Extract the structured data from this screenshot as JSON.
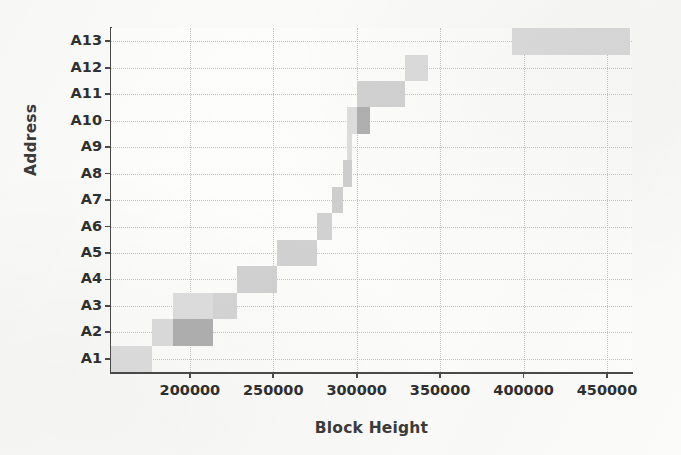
{
  "chart_data": {
    "type": "heatmap",
    "title": "",
    "xlabel": "Block Height",
    "ylabel": "Address",
    "xlim": [
      152700,
      465000
    ],
    "xticks": [
      200000,
      250000,
      300000,
      350000,
      400000,
      450000
    ],
    "xtick_labels": [
      "200000",
      "250000",
      "300000",
      "350000",
      "400000",
      "450000"
    ],
    "ylim": [
      0.5,
      13.5
    ],
    "yticks": [
      "A1",
      "A2",
      "A3",
      "A4",
      "A5",
      "A6",
      "A7",
      "A8",
      "A9",
      "A10",
      "A11",
      "A12",
      "A13"
    ],
    "categories": [
      "A1",
      "A2",
      "A3",
      "A4",
      "A5",
      "A6",
      "A7",
      "A8",
      "A9",
      "A10",
      "A11",
      "A12",
      "A13"
    ],
    "grid": true,
    "legend": "none",
    "colors": {
      "light": "#dedede",
      "medium": "#cfcfcf",
      "dark": "#b0b0b0",
      "background": "#fdfdfc",
      "axis": "#4a4a4a",
      "gridline": "#c4c4c4",
      "text": "#2f2f2f"
    },
    "cells": [
      {
        "address": "A1",
        "x_start": 152700,
        "x_end": 177000,
        "intensity": "light",
        "color": "#dedede"
      },
      {
        "address": "A2",
        "x_start": 177000,
        "x_end": 190000,
        "intensity": "light",
        "color": "#dcdcdc"
      },
      {
        "address": "A2",
        "x_start": 190000,
        "x_end": 214000,
        "intensity": "dark",
        "color": "#b0b0b0"
      },
      {
        "address": "A3",
        "x_start": 190000,
        "x_end": 214000,
        "intensity": "light",
        "color": "#dedede"
      },
      {
        "address": "A3",
        "x_start": 214000,
        "x_end": 228000,
        "intensity": "medium",
        "color": "#d5d5d5"
      },
      {
        "address": "A4",
        "x_start": 228000,
        "x_end": 252000,
        "intensity": "medium",
        "color": "#d2d2d2"
      },
      {
        "address": "A5",
        "x_start": 252000,
        "x_end": 276000,
        "intensity": "medium",
        "color": "#d2d2d2"
      },
      {
        "address": "A6",
        "x_start": 276000,
        "x_end": 285000,
        "intensity": "medium",
        "color": "#d2d2d2"
      },
      {
        "address": "A7",
        "x_start": 285000,
        "x_end": 292000,
        "intensity": "medium",
        "color": "#cfcfcf"
      },
      {
        "address": "A8",
        "x_start": 292000,
        "x_end": 297000,
        "intensity": "medium",
        "color": "#cfcfcf"
      },
      {
        "address": "A9",
        "x_start": 294000,
        "x_end": 297000,
        "intensity": "light",
        "color": "#dedede"
      },
      {
        "address": "A10",
        "x_start": 294000,
        "x_end": 300000,
        "intensity": "light",
        "color": "#dedede"
      },
      {
        "address": "A10",
        "x_start": 300000,
        "x_end": 308000,
        "intensity": "dark",
        "color": "#b0b0b0"
      },
      {
        "address": "A11",
        "x_start": 300000,
        "x_end": 329000,
        "intensity": "medium",
        "color": "#d2d2d2"
      },
      {
        "address": "A12",
        "x_start": 329000,
        "x_end": 343000,
        "intensity": "light",
        "color": "#dcdcdc"
      },
      {
        "address": "A13",
        "x_start": 393000,
        "x_end": 464000,
        "intensity": "light",
        "color": "#dcdcdc"
      }
    ]
  }
}
